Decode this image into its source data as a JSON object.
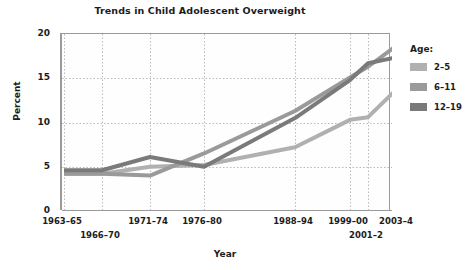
{
  "chart_data": {
    "type": "line",
    "title": "Trends in Child Adolescent Overweight",
    "xlabel": "Year",
    "ylabel": "Percent",
    "ylim": [
      0,
      20
    ],
    "yticks": [
      0,
      5,
      10,
      15,
      20
    ],
    "grid": true,
    "legend_position": "right",
    "legend_title": "Age:",
    "categories": [
      "1963–65",
      "1966–70",
      "1971–74",
      "1976–80",
      "1988–94",
      "1999–00",
      "2001–2",
      "2003–4"
    ],
    "series": [
      {
        "name": "2–5",
        "color": "#b0b0b0",
        "values": [
          4.2,
          4.2,
          5.0,
          5.2,
          7.2,
          10.3,
          10.6,
          13.9
        ]
      },
      {
        "name": "6–11",
        "color": "#9a9a9a",
        "values": [
          4.2,
          4.2,
          4.0,
          6.5,
          11.3,
          15.1,
          16.3,
          18.8
        ]
      },
      {
        "name": "12–19",
        "color": "#7a7a7a",
        "values": [
          4.6,
          4.6,
          6.1,
          5.0,
          10.5,
          14.8,
          16.7,
          17.4
        ]
      }
    ],
    "axis_color": "#9b9b9b",
    "grid_color": "#b9b9b9",
    "plot_background": "#fefefe"
  },
  "x_axis": {
    "ticks": [
      {
        "label": "1963–65",
        "x": 62,
        "row": 0
      },
      {
        "label": "1966–70",
        "x": 100,
        "row": 1
      },
      {
        "label": "1971–74",
        "x": 148,
        "row": 0
      },
      {
        "label": "1976–80",
        "x": 202,
        "row": 0
      },
      {
        "label": "1988–94",
        "x": 293,
        "row": 0
      },
      {
        "label": "1999–00",
        "x": 348,
        "row": 0
      },
      {
        "label": "2001–2",
        "x": 366,
        "row": 1
      },
      {
        "label": "2003–4",
        "x": 396,
        "row": 0
      }
    ]
  },
  "y_axis": {
    "ticks": [
      {
        "label": "20",
        "y": 33
      },
      {
        "label": "15",
        "y": 77
      },
      {
        "label": "10",
        "y": 122
      },
      {
        "label": "5",
        "y": 166
      },
      {
        "label": "0",
        "y": 210
      }
    ]
  }
}
